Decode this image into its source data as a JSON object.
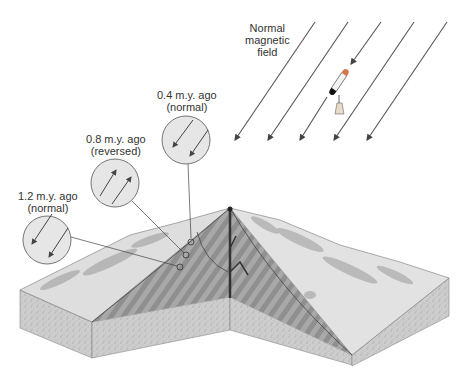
{
  "field_label": {
    "line1": "Normal",
    "line2": "magnetic",
    "line3": "field"
  },
  "samples": [
    {
      "age": "0.4 m.y. ago",
      "polarity": "(normal)",
      "direction": "normal"
    },
    {
      "age": "0.8 m.y. ago",
      "polarity": "(reversed)",
      "direction": "reversed"
    },
    {
      "age": "1.2 m.y. ago",
      "polarity": "(normal)",
      "direction": "normal"
    }
  ],
  "colors": {
    "background": "#ffffff",
    "line": "#444444",
    "circle_fill": "#e6e6e6",
    "block_side": "#cfcfcf",
    "block_top": "#dcdcdc",
    "ridge_stripes": "#9a9a9a",
    "rift": "#333333"
  }
}
